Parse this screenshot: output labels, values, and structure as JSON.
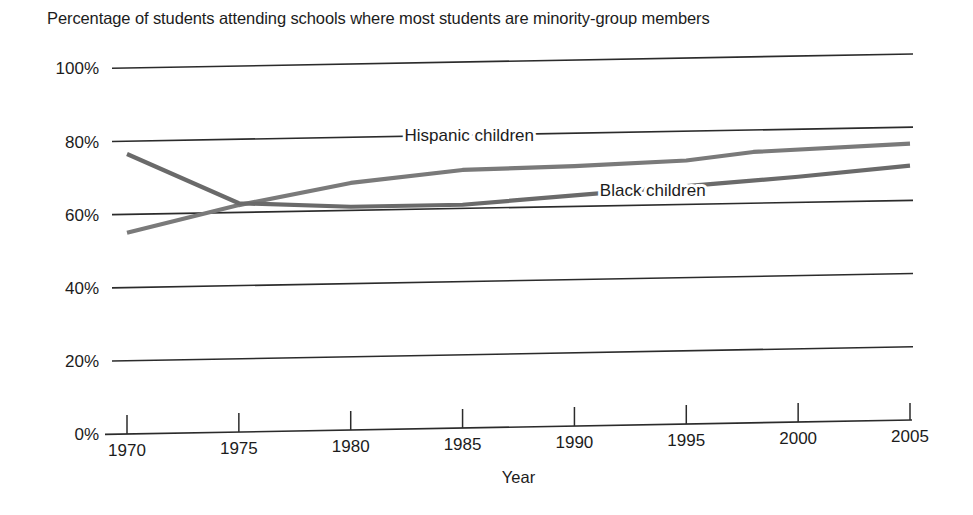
{
  "figure": {
    "title": "Percentage of students attending schools where most students are minority-group members",
    "background_color": "#ffffff",
    "text_color": "#1c1c1c"
  },
  "chart_data": {
    "type": "line",
    "title": "Percentage of students attending schools where most students are minority-group members",
    "xlabel": "Year",
    "ylabel": "",
    "xlim": [
      1970,
      2005
    ],
    "ylim": [
      0,
      100
    ],
    "x_ticks": [
      1970,
      1975,
      1980,
      1985,
      1990,
      1995,
      2000,
      2005
    ],
    "x_tick_labels": [
      "1970",
      "1975",
      "1980",
      "1985",
      "1990",
      "1995",
      "2000",
      "2005"
    ],
    "y_ticks": [
      0,
      20,
      40,
      60,
      80,
      100
    ],
    "y_tick_labels": [
      "0%",
      "20%",
      "40%",
      "60%",
      "80%",
      "100%"
    ],
    "grid": "horizontal",
    "legend": "inline-labels",
    "line_color": "#6f6f6f",
    "series": [
      {
        "name": "Hispanic children",
        "label_text": "Hispanic children",
        "color": "#7a7a7a",
        "x": [
          1970,
          1975,
          1980,
          1985,
          1990,
          1995,
          1998,
          2005
        ],
        "values": [
          55,
          62,
          67.5,
          70.5,
          71,
          72,
          74,
          75.5
        ]
      },
      {
        "name": "Black children",
        "label_text": "Black children",
        "color": "#6a6a6a",
        "x": [
          1970,
          1975,
          1980,
          1985,
          1990,
          1995,
          2000,
          2005
        ],
        "values": [
          76.5,
          62.5,
          61,
          61,
          63,
          65,
          67,
          69.5
        ]
      }
    ],
    "annotations": [
      {
        "text": "Hispanic children",
        "x": 1985.3,
        "y": 78.5
      },
      {
        "text": "Black children",
        "x": 1993.5,
        "y": 62.5
      }
    ]
  }
}
